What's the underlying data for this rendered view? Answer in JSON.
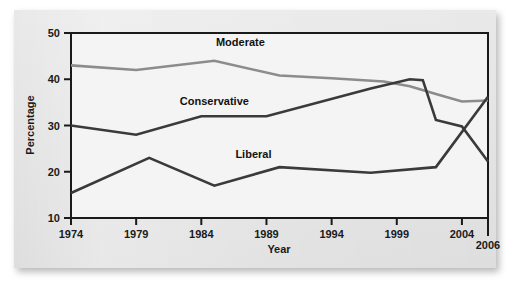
{
  "figure": {
    "background_color": "#e6e6e6",
    "plot_background_color": "#f2f2f2",
    "frame_color": "#1a1a1a"
  },
  "chart_data": {
    "type": "line",
    "title": "",
    "xlabel": "Year",
    "ylabel": "Percentage",
    "xlim": [
      1974,
      2006
    ],
    "ylim": [
      10,
      50
    ],
    "grid": false,
    "legend_position": "inline-labels",
    "x_tick_labels": [
      "1974",
      "1979",
      "1984",
      "1989",
      "1994",
      "1999",
      "2004",
      "2006"
    ],
    "x_tick_values": [
      1974,
      1979,
      1984,
      1989,
      1994,
      1999,
      2004,
      2006
    ],
    "y_tick_labels": [
      "10",
      "20",
      "30",
      "40",
      "50"
    ],
    "y_tick_values": [
      10,
      20,
      30,
      40,
      50
    ],
    "series": [
      {
        "name": "Moderate",
        "color": "#8c8c8c",
        "label_x": 1987,
        "label_y": 47.2,
        "x": [
          1974,
          1979,
          1985,
          1990,
          1994,
          1998,
          2000,
          2002,
          2004,
          2006
        ],
        "values": [
          43.0,
          42.0,
          44.0,
          40.8,
          40.2,
          39.5,
          38.5,
          36.8,
          35.2,
          35.4
        ]
      },
      {
        "name": "Conservative",
        "color": "#3a3a3a",
        "label_x": 1985,
        "label_y": 34.4,
        "x": [
          1974,
          1979,
          1984,
          1989,
          1997,
          2000,
          2001,
          2002,
          2004,
          2006
        ],
        "values": [
          30.0,
          28.0,
          32.0,
          32.0,
          38.0,
          40.0,
          39.8,
          31.2,
          29.8,
          22.2
        ]
      },
      {
        "name": "Liberal",
        "color": "#3a3a3a",
        "label_x": 1988,
        "label_y": 23.0,
        "x": [
          1974,
          1980,
          1985,
          1990,
          1997,
          2002,
          2006
        ],
        "values": [
          15.4,
          23.0,
          17.0,
          21.0,
          19.8,
          21.0,
          36.2
        ]
      }
    ]
  }
}
